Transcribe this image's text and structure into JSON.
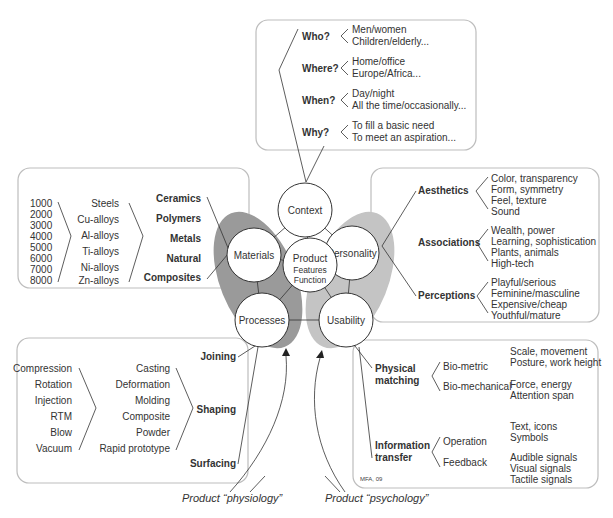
{
  "context_box": {
    "rows": [
      {
        "q": "Who?",
        "a1": "Men/women",
        "a2": "Children/elderly..."
      },
      {
        "q": "Where?",
        "a1": "Home/office",
        "a2": "Europe/Africa..."
      },
      {
        "q": "When?",
        "a1": "Day/night",
        "a2": "All the time/occasionally..."
      },
      {
        "q": "Why?",
        "a1": "To fill a basic need",
        "a2": "To meet an aspiration..."
      }
    ]
  },
  "materials_box": {
    "grades": [
      "1000",
      "2000",
      "3000",
      "4000",
      "5000",
      "6000",
      "7000",
      "8000"
    ],
    "alloys": [
      "Steels",
      "Cu-alloys",
      "Al-alloys",
      "Ti-alloys",
      "Ni-alloys",
      "Zn-alloys"
    ],
    "families": [
      "Ceramics",
      "Polymers",
      "Metals",
      "Natural",
      "Composites"
    ]
  },
  "personality_box": {
    "groups": [
      {
        "label": "Aesthetics",
        "items": [
          "Color, transparency",
          "Form, symmetry",
          "Feel, texture",
          "Sound"
        ]
      },
      {
        "label": "Associations",
        "items": [
          "Wealth, power",
          "Learning, sophistication",
          "Plants, animals",
          "High-tech"
        ]
      },
      {
        "label": "Perceptions",
        "items": [
          "Playful/serious",
          "Feminine/masculine",
          "Expensive/cheap",
          "Youthful/mature"
        ]
      }
    ]
  },
  "processes_box": {
    "molding_types": [
      "Compression",
      "Rotation",
      "Injection",
      "RTM",
      "Blow",
      "Vacuum"
    ],
    "shaping_methods": [
      "Casting",
      "Deformation",
      "Molding",
      "Composite",
      "Powder",
      "Rapid prototype"
    ],
    "categories": [
      "Joining",
      "Shaping",
      "Surfacing"
    ]
  },
  "usability_box": {
    "physical_matching": {
      "label_line1": "Physical",
      "label_line2": "matching",
      "subs": [
        {
          "label": "Bio-metric",
          "items": [
            "Scale, movement",
            "Posture, work height"
          ]
        },
        {
          "label": "Bio-mechanical",
          "items": [
            "Force, energy",
            "Attention span"
          ]
        }
      ]
    },
    "information_transfer": {
      "label_line1": "Information",
      "label_line2": "transfer",
      "subs": [
        {
          "label": "Operation",
          "items": [
            "Text, icons",
            "Symbols"
          ]
        },
        {
          "label": "Feedback",
          "items": [
            "Audible signals",
            "Visual signals",
            "Tactile signals"
          ]
        }
      ]
    },
    "credit": "MFA, 09"
  },
  "hub": {
    "context": "Context",
    "materials": "Materials",
    "personality": "Personality",
    "product_line1": "Product",
    "product_line2": "Features",
    "product_line3": "Function",
    "processes": "Processes",
    "usability": "Usability"
  },
  "captions": {
    "physiology": "Product “physiology”",
    "psychology": "Product “psychology”"
  },
  "colors": {
    "shadow_dark": "#9a9a9a",
    "shadow_light": "#c4c4c4",
    "box_border": "#bdbdbd",
    "text": "#333333"
  }
}
